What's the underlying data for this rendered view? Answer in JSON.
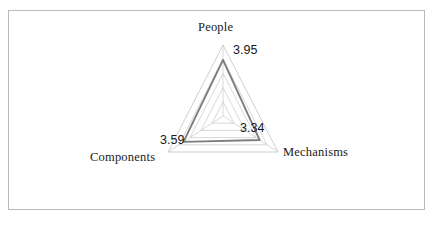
{
  "figure": {
    "background_color": "#ffffff",
    "border_color": "#b9b9b9"
  },
  "chart_data": {
    "type": "radar",
    "title": "",
    "subtitle": "",
    "xlabel": "",
    "ylabel": "",
    "categories": [
      "People",
      "Mechanisms",
      "Components"
    ],
    "values": [
      3.95,
      3.34,
      3.59
    ],
    "value_labels": [
      "3.95",
      "3.34",
      "3.59"
    ],
    "rlim": [
      0,
      5
    ],
    "grid_rings": 5,
    "grid": true,
    "legend": false,
    "legend_position": "none",
    "grid_color": "#c9c9c9",
    "series_color": "#7d7d7d",
    "series": [
      {
        "name": "",
        "values": [
          3.95,
          3.34,
          3.59
        ]
      }
    ]
  },
  "axis_labels": {
    "people": "People",
    "mechanisms": "Mechanisms",
    "components": "Components"
  },
  "data_labels": {
    "people": "3.95",
    "mechanisms": "3.34",
    "components": "3.59"
  }
}
